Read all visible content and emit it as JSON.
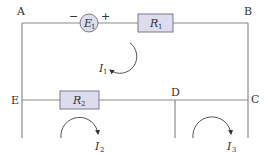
{
  "diagram": {
    "type": "electric-circuit",
    "nodes": [
      {
        "id": "A",
        "label": "A"
      },
      {
        "id": "B",
        "label": "B"
      },
      {
        "id": "C",
        "label": "C"
      },
      {
        "id": "D",
        "label": "D"
      },
      {
        "id": "E",
        "label": "E"
      }
    ],
    "components": {
      "source": {
        "symbol": "E",
        "sub": "1",
        "minus": "−",
        "plus": "+"
      },
      "r1": {
        "symbol": "R",
        "sub": "1"
      },
      "r2": {
        "symbol": "R",
        "sub": "2"
      }
    },
    "currents": [
      {
        "symbol": "I",
        "sub": "1",
        "direction": "counter-clockwise"
      },
      {
        "symbol": "I",
        "sub": "2",
        "direction": "clockwise"
      },
      {
        "symbol": "I",
        "sub": "3",
        "direction": "clockwise"
      }
    ],
    "colors": {
      "wire": "#8a8a8a",
      "component_fill": "#dcdcec",
      "component_stroke": "#7a7a8a",
      "text": "#333333"
    }
  }
}
